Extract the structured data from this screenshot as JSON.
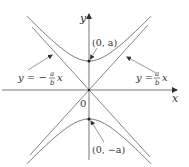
{
  "figure": {
    "type": "hyperbola",
    "colors": {
      "axis": "#555555",
      "curve": "#666666",
      "text": "#333333",
      "background": "#ffffff"
    },
    "axes": {
      "x_label": "x",
      "y_label": "y",
      "origin_label": "0"
    },
    "vertices": [
      {
        "label": "(0, a)",
        "point": "upper-vertex"
      },
      {
        "label": "(0, −a)",
        "point": "lower-vertex"
      }
    ],
    "asymptotes": [
      {
        "label_prefix": "y = −",
        "frac_num": "a",
        "frac_den": "b",
        "label_suffix": "x",
        "side": "left"
      },
      {
        "label_prefix": "y = ",
        "frac_num": "a",
        "frac_den": "b",
        "label_suffix": "x",
        "side": "right"
      }
    ]
  }
}
